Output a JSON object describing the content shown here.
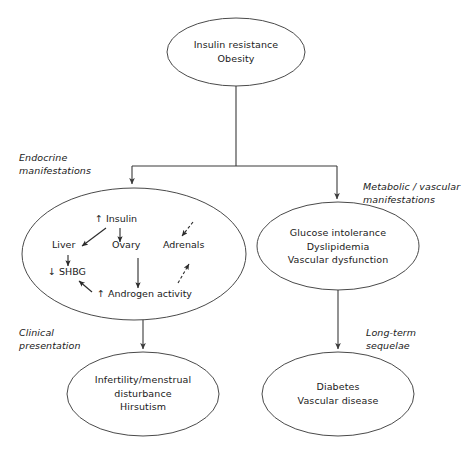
{
  "diagram": {
    "type": "flowchart",
    "orientation": "top-down",
    "stroke_color": "#3a3a3a",
    "text_color": "#1a1a1a",
    "background_color": "#ffffff",
    "nodes": [
      {
        "id": "root",
        "shape": "ellipse",
        "lines": [
          "Insulin resistance",
          "Obesity"
        ],
        "line1": "Insulin resistance",
        "line2": "Obesity"
      },
      {
        "id": "endocrine",
        "shape": "ellipse",
        "inner_labels": {
          "insulin": "↑ Insulin",
          "liver": "Liver",
          "ovary": "Ovary",
          "adrenals": "Adrenals",
          "shbg": "↓ SHBG",
          "androgen": "↑ Androgen activity"
        }
      },
      {
        "id": "metabolic",
        "shape": "ellipse",
        "lines": [
          "Glucose intolerance",
          "Dyslipidemia",
          "Vascular dysfunction"
        ],
        "line1": "Glucose intolerance",
        "line2": "Dyslipidemia",
        "line3": "Vascular dysfunction"
      },
      {
        "id": "clinical",
        "shape": "ellipse",
        "lines": [
          "Infertility/menstrual",
          "disturbance",
          "Hirsutism"
        ],
        "line1": "Infertility/menstrual",
        "line2": "disturbance",
        "line3": "Hirsutism"
      },
      {
        "id": "sequelae",
        "shape": "ellipse",
        "lines": [
          "Diabetes",
          "Vascular disease"
        ],
        "line1": "Diabetes",
        "line2": "Vascular disease"
      }
    ],
    "section_labels": {
      "endocrine_line1": "Endocrine",
      "endocrine_line2": "manifestations",
      "metabolic_line1": "Metabolic / vascular",
      "metabolic_line2": "manifestations",
      "clinical_line1": "Clinical",
      "clinical_line2": "presentation",
      "sequelae_line1": "Long-term",
      "sequelae_line2": "sequelae"
    }
  }
}
